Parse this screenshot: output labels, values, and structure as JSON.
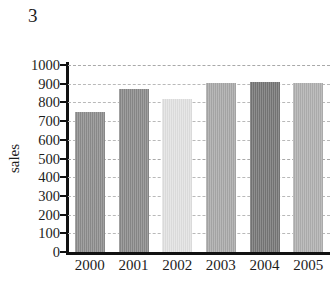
{
  "figure": {
    "number": "3"
  },
  "chart_data": {
    "type": "bar",
    "title": "",
    "subtitle": "",
    "xlabel": "",
    "ylabel": "sales",
    "categories": [
      "2000",
      "2001",
      "2002",
      "2003",
      "2004",
      "2005"
    ],
    "values": [
      750,
      870,
      820,
      905,
      910,
      905
    ],
    "series": [
      {
        "name": "sales",
        "values": [
          750,
          870,
          820,
          905,
          910,
          905
        ]
      }
    ],
    "bar_colors": [
      "#8d8d8d",
      "#8a8a8a",
      "#e2e2e2",
      "#a9a9a9",
      "#767676",
      "#b0b0b0"
    ],
    "ylim": [
      0,
      1000
    ],
    "ytick_step": 100,
    "yticks": [
      "0",
      "100",
      "200",
      "300",
      "400",
      "500",
      "600",
      "700",
      "800",
      "900",
      "1000"
    ],
    "grid": true,
    "grid_style": "dashed",
    "legend": false,
    "legend_position": "none",
    "axis_color": "#111111",
    "grid_color": "#b9b9b9",
    "background": "#ffffff"
  }
}
